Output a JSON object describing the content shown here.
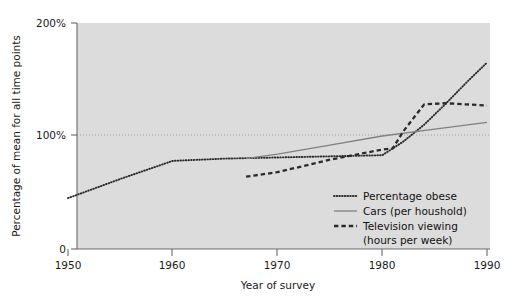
{
  "chart_data": {
    "type": "line",
    "title": "",
    "xlabel": "Year of survey",
    "ylabel": "Percentage of mean for all time points",
    "xlim": [
      1950,
      1990
    ],
    "ylim": [
      0,
      200
    ],
    "xticks": [
      "1950",
      "1960",
      "1970",
      "1980",
      "1990"
    ],
    "xtick_values": [
      1950,
      1960,
      1970,
      1980,
      1990
    ],
    "yticks": [
      "0",
      "100%",
      "200%"
    ],
    "ytick_values": [
      0,
      100,
      200
    ],
    "grid": "horizontal dotted gridline at 100%",
    "gridline_values": [
      100
    ],
    "legend_position": "inside lower right",
    "plot_background": "#dcdcdc",
    "series": [
      {
        "name": "Percentage obese",
        "style": "dotted",
        "color": "#2b2b2b",
        "x": [
          1950,
          1955,
          1960,
          1965,
          1970,
          1975,
          1980,
          1982,
          1984,
          1986,
          1988,
          1990
        ],
        "values": [
          45,
          62,
          78,
          80,
          81,
          82,
          83,
          95,
          110,
          128,
          147,
          165
        ]
      },
      {
        "name": "Cars (per houshold)",
        "style": "solid",
        "color": "#808080",
        "x": [
          1967,
          1970,
          1975,
          1980,
          1985,
          1990
        ],
        "values": [
          80,
          84,
          92,
          100,
          106,
          112
        ]
      },
      {
        "name": "Television viewing (hours per week)",
        "style": "dashed",
        "color": "#2b2b2b",
        "x": [
          1967,
          1970,
          1975,
          1980,
          1981,
          1982,
          1984,
          1986,
          1988,
          1990
        ],
        "values": [
          64,
          68,
          79,
          88,
          89,
          104,
          128,
          129,
          128,
          127
        ]
      }
    ]
  },
  "axis": {
    "y_title": "Percentage of mean for all time points",
    "x_title": "Year of survey",
    "ytick_labels": [
      "200%",
      "100%",
      "0"
    ],
    "xtick_labels": [
      "1950",
      "1960",
      "1970",
      "1980",
      "1990"
    ]
  },
  "legend": {
    "entries": [
      {
        "label": "Percentage obese",
        "marker": "dotted-line-swatch"
      },
      {
        "label": "Cars (per houshold)",
        "marker": "solid-line-swatch"
      },
      {
        "label": "Television viewing",
        "marker": "dashed-line-swatch"
      },
      {
        "label": "(hours per week)",
        "marker": "none"
      }
    ]
  }
}
